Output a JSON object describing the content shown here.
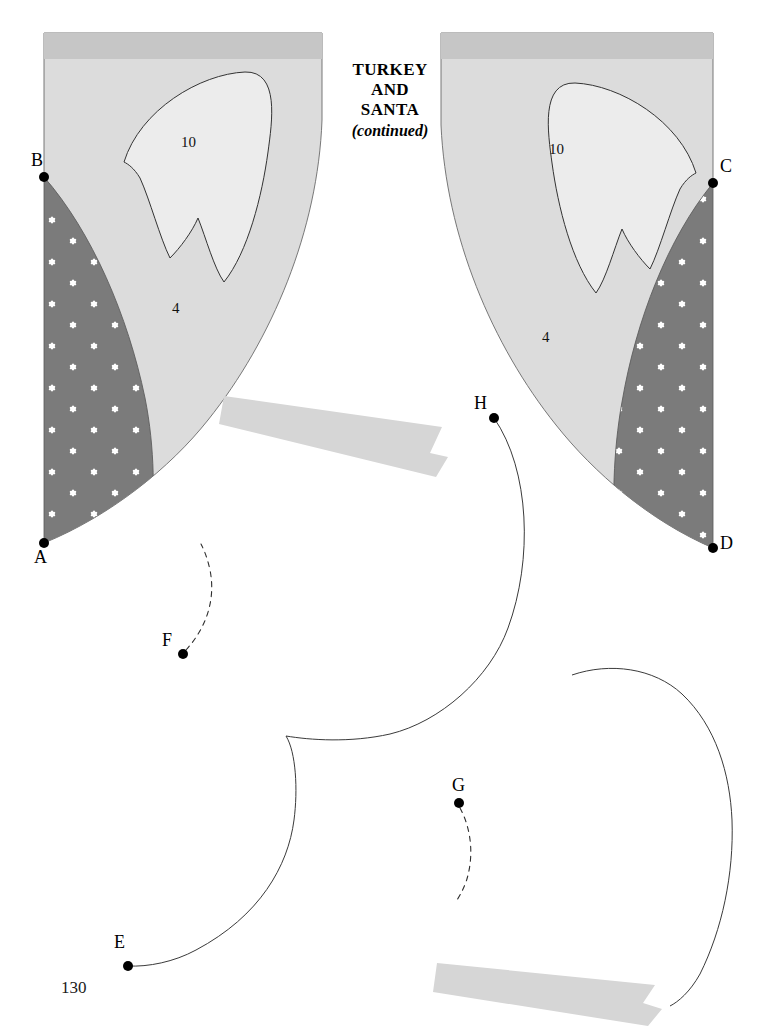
{
  "document": {
    "title_lines": [
      "TURKEY",
      "AND",
      "SANTA"
    ],
    "title_continued": "(continued)",
    "page_number": "130"
  },
  "colors": {
    "page_background": "#ffffff",
    "piece_body": "#dcdcdc",
    "piece_top_band": "#c6c6c6",
    "applique_light": "#ececec",
    "dark_print_fabric": "#7b7b7b",
    "flower_motif": "#ffffff",
    "ribbon_band": "#d6d6d6",
    "outline_stroke": "#4a4a4a",
    "marker_dot": "#000000",
    "text": "#000000"
  },
  "pieces": [
    {
      "id": "left-piece",
      "name": "turkey-santa-left-pattern-piece",
      "piece_numbers": [
        {
          "label": "10",
          "x": 188,
          "y": 142
        },
        {
          "label": "4",
          "x": 176,
          "y": 308
        }
      ],
      "points": [
        {
          "label": "B",
          "x": 44,
          "y": 177,
          "label_x": 33,
          "label_y": 155
        },
        {
          "label": "A",
          "x": 44,
          "y": 543,
          "label_x": 36,
          "label_y": 553
        }
      ]
    },
    {
      "id": "right-piece",
      "name": "turkey-santa-right-pattern-piece",
      "piece_numbers": [
        {
          "label": "10",
          "x": 556,
          "y": 149
        },
        {
          "label": "4",
          "x": 546,
          "y": 337
        }
      ],
      "points": [
        {
          "label": "C",
          "x": 713,
          "y": 183,
          "label_x": 722,
          "label_y": 161
        },
        {
          "label": "D",
          "x": 713,
          "y": 548,
          "label_x": 722,
          "label_y": 538
        }
      ]
    }
  ],
  "lower_markers": [
    {
      "label": "H",
      "x": 494,
      "y": 418,
      "label_x": 476,
      "label_y": 398
    },
    {
      "label": "F",
      "x": 183,
      "y": 654,
      "label_x": 164,
      "label_y": 634
    },
    {
      "label": "G",
      "x": 459,
      "y": 803,
      "label_x": 455,
      "label_y": 778
    },
    {
      "label": "E",
      "x": 128,
      "y": 966,
      "label_x": 117,
      "label_y": 937
    }
  ],
  "ribbons": [
    {
      "name": "upper-ribbon-band",
      "description": "light gray band with notched right end, angled downward"
    },
    {
      "name": "lower-ribbon-band",
      "description": "light gray band with notched right end, angled downward"
    }
  ],
  "icons": {
    "flower_motif": "six-petal-flower-icon",
    "marker": "point-marker-dot-icon"
  }
}
